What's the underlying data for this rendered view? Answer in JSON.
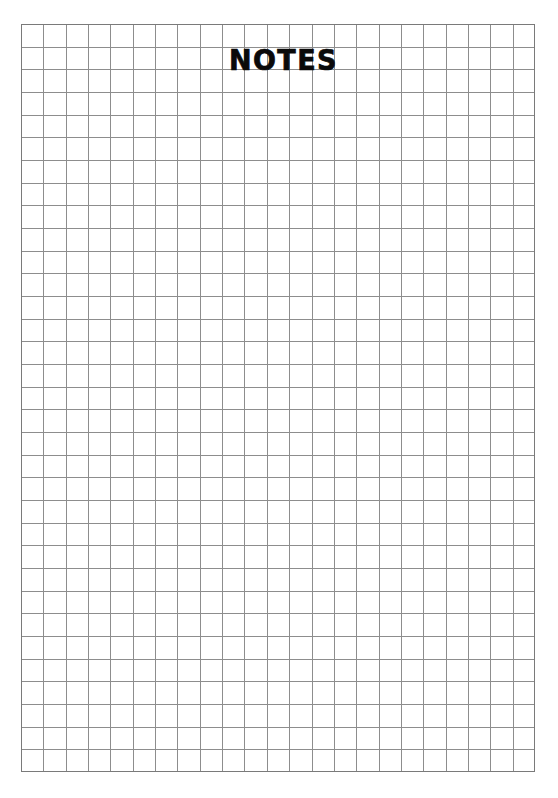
{
  "page": {
    "kind": "printable-notes-sheet",
    "background_color": "#ffffff",
    "width_px": 558,
    "height_px": 798
  },
  "header": {
    "title": "NOTES",
    "title_color": "#0a0a0a"
  },
  "grid": {
    "label": "squared-note-grid",
    "columns": 23,
    "rows": 33,
    "cell_size_px": 22.35,
    "origin_x_px": 21,
    "origin_y_px": 24,
    "width_px": 514,
    "height_px": 748,
    "line_color": "#8d8d8d",
    "border_color": "#7a7a7a",
    "line_width_px": 1
  },
  "chart_data": {
    "type": "table",
    "title": "NOTES",
    "xlabel": "",
    "ylabel": "",
    "categories": [],
    "values": [],
    "grid": true,
    "legend": "none"
  }
}
